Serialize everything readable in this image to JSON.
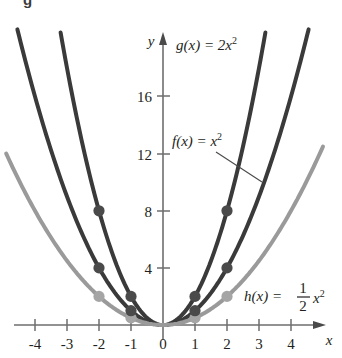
{
  "figure": {
    "caption_remnant": "g",
    "background_color": "#ffffff"
  },
  "axes": {
    "x_axis_label": "x",
    "y_axis_label": "y",
    "x_ticks": [
      "-4",
      "-3",
      "-2",
      "-1",
      "0",
      "1",
      "2",
      "3",
      "4"
    ],
    "y_ticks": [
      "4",
      "8",
      "12",
      "16"
    ],
    "origin_label": "0"
  },
  "labels": {
    "g_label_prefix": "g(x) = 2x",
    "g_label_exp": "2",
    "f_label_prefix": "f(x) = x",
    "f_label_exp": "2",
    "h_label_prefix": "h(x) = ",
    "h_num": "1",
    "h_den": "2",
    "h_var": "x",
    "h_exp": "2"
  },
  "colors": {
    "curve_g": "#3a3a3a",
    "curve_f": "#3a3a3a",
    "curve_h": "#9a9a9a",
    "axis": "#6e6e6e",
    "marker_dark": "#4a4a4a",
    "marker_light": "#a5a5a5",
    "text": "#231f20"
  },
  "chart_data": {
    "type": "line",
    "title": "",
    "xlabel": "x",
    "ylabel": "y",
    "xlim": [
      -4.6,
      4.6
    ],
    "ylim": [
      -0.6,
      18.5
    ],
    "grid": false,
    "legend": "inline-annotations",
    "x_ticks": [
      -4,
      -3,
      -2,
      -1,
      0,
      1,
      2,
      3,
      4
    ],
    "y_ticks": [
      4,
      8,
      12,
      16
    ],
    "series": [
      {
        "name": "g(x) = 2x^2",
        "label": "g(x) = 2x²",
        "color": "#3a3a3a",
        "coefficient": 2,
        "x": [
          -3.05,
          -2.5,
          -2,
          -1.5,
          -1,
          -0.5,
          0,
          0.5,
          1,
          1.5,
          2,
          2.5,
          3.05
        ],
        "y": [
          18.6,
          12.5,
          8,
          4.5,
          2,
          0.5,
          0,
          0.5,
          2,
          4.5,
          8,
          12.5,
          18.6
        ],
        "markers": [
          {
            "x": -2,
            "y": 8
          },
          {
            "x": -1,
            "y": 2
          },
          {
            "x": 1,
            "y": 2
          },
          {
            "x": 2,
            "y": 8
          }
        ]
      },
      {
        "name": "f(x) = x^2",
        "label": "f(x) = x²",
        "color": "#3a3a3a",
        "coefficient": 1,
        "x": [
          -4.3,
          -3.5,
          -3,
          -2,
          -1,
          0,
          1,
          2,
          3,
          3.5,
          4.3
        ],
        "y": [
          18.5,
          12.25,
          9,
          4,
          1,
          0,
          1,
          4,
          9,
          12.25,
          18.5
        ],
        "markers": [
          {
            "x": -2,
            "y": 4
          },
          {
            "x": -1,
            "y": 1
          },
          {
            "x": 1,
            "y": 1
          },
          {
            "x": 2,
            "y": 4
          }
        ]
      },
      {
        "name": "h(x) = (1/2)x^2",
        "label": "h(x) = ½x²",
        "color": "#9a9a9a",
        "coefficient": 0.5,
        "x": [
          -4.5,
          -4,
          -3,
          -2,
          -1,
          0,
          1,
          2,
          3,
          4,
          4.5
        ],
        "y": [
          10.125,
          8,
          4.5,
          2,
          0.5,
          0,
          0.5,
          2,
          4.5,
          8,
          10.125
        ],
        "markers": [
          {
            "x": -2,
            "y": 2
          },
          {
            "x": -1,
            "y": 0.5
          },
          {
            "x": 1,
            "y": 0.5
          },
          {
            "x": 2,
            "y": 2
          }
        ]
      }
    ],
    "annotations": [
      {
        "text": "g(x) = 2x²",
        "x_px": 176,
        "y_px": 45
      },
      {
        "text": "f(x) = x²",
        "x_px": 172,
        "y_px": 140,
        "leader_to_px": [
          259,
          178
        ]
      },
      {
        "text": "h(x) = ½x²",
        "x_px": 244,
        "y_px": 296
      }
    ]
  }
}
